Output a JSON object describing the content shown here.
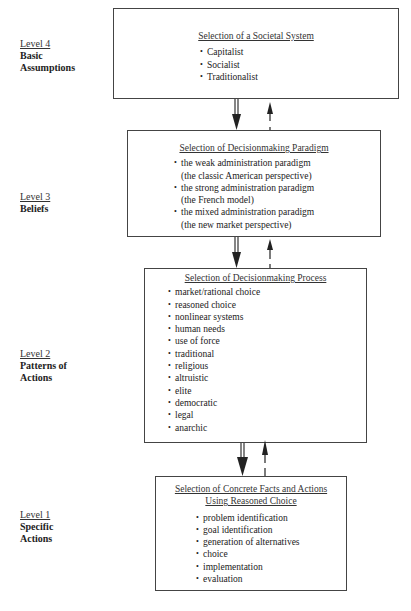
{
  "levels": [
    {
      "number": "Level 4",
      "name_lines": [
        "Basic",
        "Assumptions"
      ]
    },
    {
      "number": "Level 3",
      "name_lines": [
        "Beliefs"
      ]
    },
    {
      "number": "Level 2",
      "name_lines": [
        "Patterns of",
        "Actions"
      ]
    },
    {
      "number": "Level 1",
      "name_lines": [
        "Specific",
        "Actions"
      ]
    }
  ],
  "boxes": [
    {
      "title": "Selection of a Societal System",
      "items": [
        "Capitalist",
        "Socialist",
        "Traditionalist"
      ]
    },
    {
      "title": "Selection of Decisionmaking Paradigm",
      "items": [
        {
          "main": "the weak administration paradigm",
          "sub": "(the classic American perspective)"
        },
        {
          "main": "the strong administration paradigm",
          "sub": "(the French model)"
        },
        {
          "main": "the mixed administration paradigm",
          "sub": "(the new market perspective)"
        }
      ]
    },
    {
      "title": "Selection of Decisionmaking Process",
      "items": [
        "market/rational choice",
        "reasoned choice",
        "nonlinear systems",
        "human needs",
        "use of force",
        "traditional",
        "religious",
        "altruistic",
        "elite",
        "democratic",
        "legal",
        "anarchic"
      ]
    },
    {
      "title_lines": [
        "Selection of Concrete Facts and Actions",
        "Using Reasoned Choice"
      ],
      "items": [
        "problem identification",
        "goal identification",
        "generation of alternatives",
        "choice",
        "implementation",
        "evaluation"
      ]
    }
  ],
  "connectors": [
    {
      "from": "Level 4",
      "to": "Level 3",
      "down": "double-line solid arrow",
      "up": "dashed arrow"
    },
    {
      "from": "Level 3",
      "to": "Level 2",
      "down": "double-line solid arrow",
      "up": "dashed arrow"
    },
    {
      "from": "Level 2",
      "to": "Level 1",
      "down": "double-line solid arrow",
      "up": "dashed arrow"
    }
  ]
}
